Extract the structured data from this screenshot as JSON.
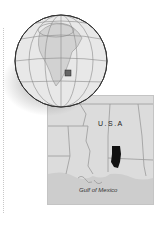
{
  "figure": {
    "type": "locator-map",
    "globe": {
      "region_shown": "North America",
      "highlight_marker": "square"
    },
    "inset_map": {
      "country_label": "U.S.A",
      "water_label": "Gulf of Mexico",
      "highlighted_area": "black"
    },
    "colors": {
      "land": "#dcdcdc",
      "water": "#cfcfcf",
      "borders": "#9a9a9a",
      "highlight": "#111111",
      "globe_fill": "#e6e6e6",
      "globe_outline": "#444444"
    }
  }
}
